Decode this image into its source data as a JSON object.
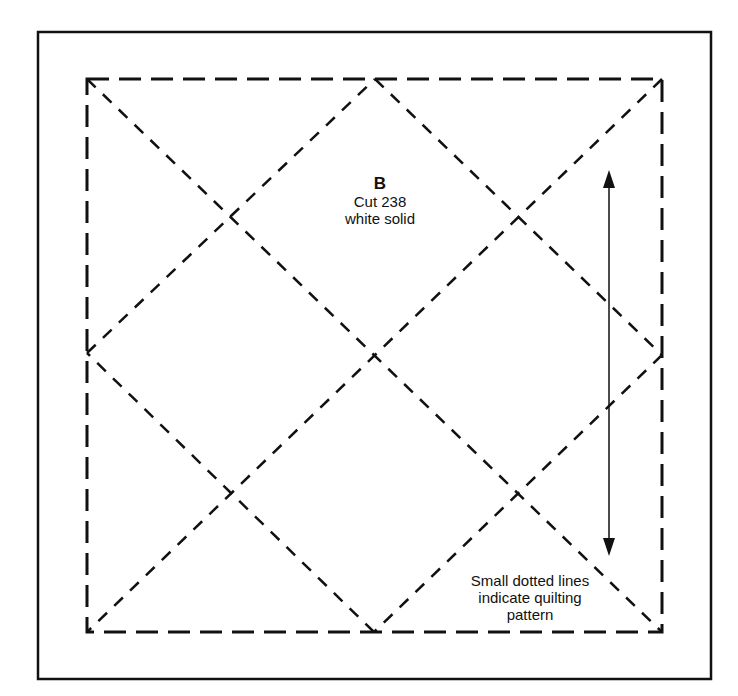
{
  "piece": {
    "letter": "B",
    "cut": "Cut 238",
    "fabric": "white solid"
  },
  "note": {
    "lines": [
      "Small dotted lines",
      "indicate quilting",
      "pattern"
    ]
  },
  "colors": {
    "background": "#ffffff",
    "ink": "#111111"
  },
  "geometry": {
    "outer_border": {
      "x1": 38,
      "y1": 32,
      "x2": 711,
      "y2": 679
    },
    "seam_square": {
      "x1": 87,
      "y1": 79,
      "x2": 662,
      "y2": 632
    },
    "grain_arrow": {
      "x": 609,
      "y_top": 170,
      "y_bottom": 556
    }
  }
}
